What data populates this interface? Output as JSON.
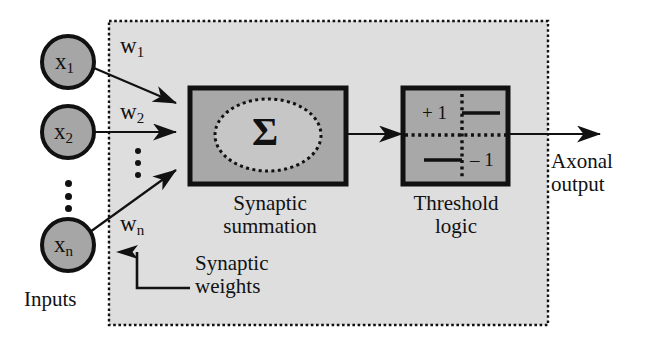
{
  "diagram": {
    "inputs": {
      "label": "Inputs",
      "nodes": [
        {
          "base": "x",
          "sub": "1"
        },
        {
          "base": "x",
          "sub": "2"
        },
        {
          "base": "x",
          "sub": "n"
        }
      ],
      "ellipsis": "•••"
    },
    "weights": {
      "annotation": "Synaptic\nweights",
      "annotation_line1": "Synaptic",
      "annotation_line2": "weights",
      "labels": [
        {
          "base": "w",
          "sub": "1"
        },
        {
          "base": "w",
          "sub": "2"
        },
        {
          "base": "w",
          "sub": "n"
        }
      ],
      "ellipsis": "•••"
    },
    "summation": {
      "symbol": "Σ",
      "caption_line1": "Synaptic",
      "caption_line2": "summation"
    },
    "threshold": {
      "caption_line1": "Threshold",
      "caption_line2": "logic",
      "high_value": "+ 1",
      "low_value": "– 1"
    },
    "output": {
      "label_line1": "Axonal",
      "label_line2": "output"
    }
  },
  "colors": {
    "panel_fill": "#dedede",
    "box_fill": "#a8a8a8",
    "node_fill": "#a6a6a6",
    "ellipse_fill": "#c4c4c4",
    "stroke": "#111111",
    "background": "#ffffff"
  }
}
